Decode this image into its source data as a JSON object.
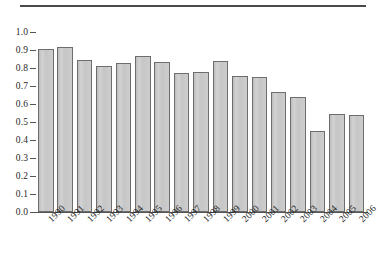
{
  "figure": {
    "top_rule": true,
    "background_color": "#ffffff"
  },
  "chart_data": {
    "type": "bar",
    "title": "",
    "subtitle": "",
    "xlabel": "",
    "ylabel": "",
    "categories": [
      "1990",
      "1991",
      "1992",
      "1993",
      "1994",
      "1995",
      "1996",
      "1997",
      "1998",
      "1999",
      "2000",
      "2001",
      "2002",
      "2003",
      "2004",
      "2005",
      "2006"
    ],
    "values": [
      0.905,
      0.915,
      0.845,
      0.813,
      0.83,
      0.866,
      0.836,
      0.771,
      0.776,
      0.841,
      0.756,
      0.751,
      0.669,
      0.639,
      0.449,
      0.545,
      0.537
    ],
    "ylim": [
      0.0,
      1.0
    ],
    "yticks": [
      "1.0",
      "0.9",
      "0.8",
      "0.7",
      "0.6",
      "0.5",
      "0.4",
      "0.3",
      "0.2",
      "0.1",
      "0.0"
    ],
    "ytick_values": [
      1.0,
      0.9,
      0.8,
      0.7,
      0.6,
      0.5,
      0.4,
      0.3,
      0.2,
      0.1,
      0.0
    ],
    "grid": false,
    "legend": null,
    "legend_position": "none",
    "bar_fill_color": "#c9c9c9",
    "bar_edge_color": "#6d6d6d",
    "axis_color": "#555555",
    "xtick_rotation": -45
  }
}
